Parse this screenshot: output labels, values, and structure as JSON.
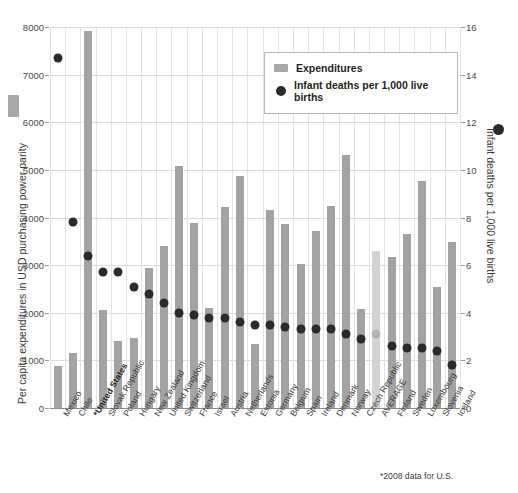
{
  "legend": {
    "items": [
      {
        "label": "Expenditures",
        "marker": "bar-swatch-icon",
        "color": "#a8a8a8"
      },
      {
        "label": "Infant deaths per 1,000 live births",
        "marker": "circle-dot-icon",
        "color": "#2b2b2b"
      }
    ]
  },
  "axis": {
    "left_title": "Per capita expenditures in USD purchasing power parity",
    "right_title": "Infant deaths per 1,000 live births"
  },
  "footnote": "*2008 data for U.S.",
  "top_clipped_text": "",
  "chart_data": {
    "type": "bar",
    "title": "",
    "subtitle": "",
    "xlabel": "",
    "ylabel": "Per capita expenditures in USD purchasing power parity",
    "y2label": "Infant deaths per 1,000 live births",
    "ylim": [
      0,
      8000
    ],
    "y2lim": [
      0,
      16
    ],
    "yticks": [
      0,
      1000,
      2000,
      3000,
      4000,
      5000,
      6000,
      7000,
      8000
    ],
    "y2ticks": [
      0,
      2,
      4,
      6,
      8,
      10,
      12,
      14,
      16
    ],
    "grid": true,
    "legend_position": "top-right-inside",
    "highlight_category": "*United States",
    "muted_category": "AVERAGE",
    "categories": [
      "Mexico",
      "Chile",
      "*United States",
      "Slovak Republic",
      "Poland",
      "Hungary",
      "New Zealand",
      "United Kingdom",
      "Switzerland",
      "France",
      "Israel",
      "Austria",
      "Netherlands",
      "Estonia",
      "Germany",
      "Belgium",
      "Spain",
      "Ireland",
      "Denmark",
      "Norway",
      "Czech Republic",
      "AVERAGE",
      "Finland",
      "Sweden",
      "Luxembourg",
      "Slovenia",
      "Iceland"
    ],
    "series": [
      {
        "name": "Expenditures",
        "axis": "left",
        "unit": "USD PPP per capita",
        "color": "#a3a3a3",
        "values": [
          880,
          1160,
          7910,
          2050,
          1400,
          1470,
          2930,
          3400,
          5090,
          3890,
          2110,
          4230,
          4880,
          1340,
          4150,
          3870,
          3020,
          3710,
          4240,
          5320,
          2080,
          3290,
          3180,
          3660,
          4770,
          2540,
          3490
        ]
      },
      {
        "name": "Infant deaths per 1,000 live births",
        "axis": "right",
        "unit": "deaths per 1,000 live births",
        "color": "#2b2b2b",
        "values": [
          14.7,
          7.8,
          6.4,
          5.7,
          5.7,
          5.1,
          4.8,
          4.4,
          4.0,
          3.9,
          3.8,
          3.8,
          3.6,
          3.5,
          3.5,
          3.4,
          3.3,
          3.3,
          3.3,
          3.1,
          2.9,
          3.1,
          2.6,
          2.5,
          2.5,
          2.4,
          1.8
        ]
      }
    ]
  }
}
